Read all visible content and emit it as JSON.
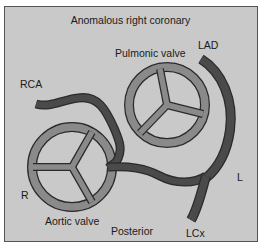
{
  "title": "Anomalous right coronary",
  "labels": {
    "pulmonic_valve": "Pulmonic valve",
    "lad": "LAD",
    "rca": "RCA",
    "right": "R",
    "left": "L",
    "aortic_valve": "Aortic valve",
    "posterior": "Posterior",
    "lcx": "LCx"
  },
  "colors": {
    "background": "#c9c9c9",
    "valve_fill": "#8a8a8a",
    "artery_fill": "#4a4a4a",
    "outline": "#2a2a2a"
  }
}
